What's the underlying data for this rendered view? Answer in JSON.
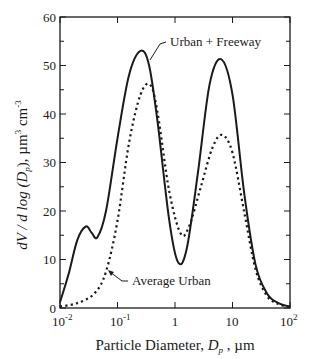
{
  "chart_data": {
    "type": "line",
    "title": "",
    "xlabel": "Particle Diameter, D_p, µm",
    "ylabel": "dV / d log (D_p), µm^3 cm^-3",
    "xscale": "log",
    "xlim": [
      0.01,
      100
    ],
    "ylim": [
      0,
      60
    ],
    "x_ticks": [
      "10^-2",
      "10^-1",
      "1",
      "10",
      "10^2"
    ],
    "y_ticks": [
      0,
      10,
      20,
      30,
      40,
      50,
      60
    ],
    "grid": false,
    "legend": "inline annotations with leader lines",
    "series": [
      {
        "name": "Urban + Freeway",
        "style": "solid",
        "log10_x": [
          -2.0,
          -1.85,
          -1.7,
          -1.55,
          -1.45,
          -1.35,
          -1.2,
          -1.0,
          -0.8,
          -0.6,
          -0.45,
          -0.3,
          -0.1,
          0.05,
          0.2,
          0.4,
          0.6,
          0.8,
          1.0,
          1.2,
          1.4,
          1.6,
          1.8,
          2.0
        ],
        "values": [
          1.2,
          7,
          14,
          16.8,
          15.5,
          14.6,
          20,
          35,
          48,
          53,
          50,
          38,
          18,
          9.5,
          12,
          28,
          46,
          51.3,
          44,
          24,
          9,
          3,
          1,
          0.3
        ]
      },
      {
        "name": "Average Urban",
        "style": "dotted",
        "log10_x": [
          -2.0,
          -1.7,
          -1.4,
          -1.2,
          -1.0,
          -0.8,
          -0.6,
          -0.43,
          -0.3,
          -0.1,
          0.1,
          0.25,
          0.45,
          0.65,
          0.82,
          1.0,
          1.2,
          1.4,
          1.6,
          1.8,
          2.0
        ],
        "values": [
          0.3,
          1,
          3,
          7.5,
          18,
          34,
          44,
          46,
          40,
          24,
          15.3,
          17,
          25,
          33,
          35.7,
          32,
          20,
          8,
          2.5,
          0.8,
          0.2
        ]
      }
    ],
    "annotations": [
      {
        "text": "Urban + Freeway",
        "series": "Urban + Freeway"
      },
      {
        "text": "Average Urban",
        "series": "Average Urban"
      }
    ]
  },
  "labels": {
    "y_axis_title_main": "dV / d log (D",
    "y_axis_title_sub": "p",
    "y_axis_title_unit": "),  µm",
    "y_axis_title_exp1": "3",
    "y_axis_title_cm": " cm",
    "y_axis_title_exp2": "-3",
    "x_axis_title_main": "Particle   Diameter,   ",
    "x_axis_title_var": "D",
    "x_axis_title_sub": "p",
    "x_axis_title_unit": " ,  µm",
    "ann_solid": "Urban + Freeway",
    "ann_dotted": "Average Urban",
    "y_tick_labels": [
      "0",
      "10",
      "20",
      "30",
      "40",
      "50",
      "60"
    ],
    "x_tick_base": "10",
    "x_tick_1": "1",
    "x_tick_10": "10",
    "x_tick_exp_m2": "-2",
    "x_tick_exp_m1": "-1",
    "x_tick_exp_2": "2"
  },
  "colors": {
    "line": "#1a1a1a",
    "background": "#ffffff"
  }
}
